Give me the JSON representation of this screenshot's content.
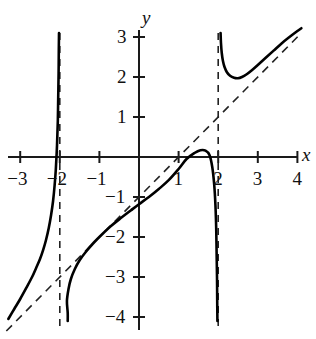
{
  "chart_data": {
    "type": "line",
    "title": "",
    "subtitle": "",
    "xlabel": "x",
    "ylabel": "y",
    "xlim": [
      -3.3,
      4.2
    ],
    "ylim": [
      -4.2,
      3.3
    ],
    "grid": false,
    "legend": null,
    "x_ticks": [
      {
        "value": -3,
        "label": "−3"
      },
      {
        "value": -2,
        "label": "−2"
      },
      {
        "value": -1,
        "label": "−1"
      },
      {
        "value": 1,
        "label": "1"
      },
      {
        "value": 2,
        "label": "2"
      },
      {
        "value": 3,
        "label": "3"
      },
      {
        "value": 4,
        "label": "4"
      }
    ],
    "y_ticks": [
      {
        "value": 3,
        "label": "3"
      },
      {
        "value": 2,
        "label": "2"
      },
      {
        "value": 1,
        "label": "1"
      },
      {
        "value": -1,
        "label": "−1"
      },
      {
        "value": -2,
        "label": "−2"
      },
      {
        "value": -3,
        "label": "−3"
      },
      {
        "value": -4,
        "label": "−4"
      }
    ],
    "asymptotes": [
      {
        "name": "vertical-asymptote-left",
        "kind": "vertical",
        "x": -2,
        "style": "dashed"
      },
      {
        "name": "vertical-asymptote-right",
        "kind": "vertical",
        "x": 2,
        "style": "dashed"
      },
      {
        "name": "slant-asymptote",
        "kind": "slant",
        "slope": 1,
        "intercept": -1,
        "equation": "y = x − 1",
        "style": "dashed"
      }
    ],
    "series": [
      {
        "name": "branch-left",
        "style": "solid",
        "color": "#000000",
        "points": [
          [
            -3.3,
            -4.05
          ],
          [
            -3.15,
            -3.8
          ],
          [
            -3.0,
            -3.55
          ],
          [
            -2.85,
            -3.28
          ],
          [
            -2.7,
            -3.0
          ],
          [
            -2.6,
            -2.78
          ],
          [
            -2.5,
            -2.55
          ],
          [
            -2.42,
            -2.32
          ],
          [
            -2.35,
            -2.08
          ],
          [
            -2.28,
            -1.78
          ],
          [
            -2.22,
            -1.45
          ],
          [
            -2.17,
            -1.1
          ],
          [
            -2.13,
            -0.7
          ],
          [
            -2.1,
            -0.3
          ],
          [
            -2.07,
            0.3
          ],
          [
            -2.05,
            0.9
          ],
          [
            -2.04,
            1.5
          ],
          [
            -2.03,
            2.1
          ],
          [
            -2.025,
            2.7
          ],
          [
            -2.02,
            3.1
          ]
        ]
      },
      {
        "name": "branch-middle",
        "style": "solid",
        "color": "#000000",
        "points": [
          [
            -1.8,
            -4.1
          ],
          [
            -1.8,
            -3.9
          ],
          [
            -1.82,
            -3.6
          ],
          [
            -1.78,
            -3.3
          ],
          [
            -1.72,
            -3.05
          ],
          [
            -1.62,
            -2.8
          ],
          [
            -1.5,
            -2.58
          ],
          [
            -1.35,
            -2.38
          ],
          [
            -1.15,
            -2.15
          ],
          [
            -0.95,
            -1.95
          ],
          [
            -0.7,
            -1.72
          ],
          [
            -0.45,
            -1.52
          ],
          [
            -0.2,
            -1.33
          ],
          [
            0.0,
            -1.18
          ],
          [
            0.25,
            -1.0
          ],
          [
            0.5,
            -0.8
          ],
          [
            0.75,
            -0.58
          ],
          [
            1.0,
            -0.3
          ],
          [
            1.2,
            -0.05
          ],
          [
            1.4,
            0.1
          ],
          [
            1.55,
            0.17
          ],
          [
            1.68,
            0.16
          ],
          [
            1.78,
            0.05
          ],
          [
            1.85,
            -0.25
          ],
          [
            1.9,
            -0.7
          ],
          [
            1.93,
            -1.2
          ],
          [
            1.95,
            -1.8
          ],
          [
            1.96,
            -2.4
          ],
          [
            1.97,
            -3.0
          ],
          [
            1.975,
            -3.6
          ],
          [
            1.98,
            -4.1
          ]
        ]
      },
      {
        "name": "branch-right",
        "style": "solid",
        "color": "#000000",
        "points": [
          [
            2.06,
            3.1
          ],
          [
            2.07,
            2.85
          ],
          [
            2.09,
            2.6
          ],
          [
            2.12,
            2.4
          ],
          [
            2.16,
            2.25
          ],
          [
            2.22,
            2.12
          ],
          [
            2.3,
            2.03
          ],
          [
            2.4,
            1.98
          ],
          [
            2.5,
            1.97
          ],
          [
            2.6,
            2.0
          ],
          [
            2.72,
            2.07
          ],
          [
            2.85,
            2.17
          ],
          [
            3.0,
            2.3
          ],
          [
            3.2,
            2.48
          ],
          [
            3.4,
            2.66
          ],
          [
            3.6,
            2.84
          ],
          [
            3.8,
            3.0
          ],
          [
            4.0,
            3.15
          ],
          [
            4.1,
            3.22
          ]
        ]
      }
    ]
  },
  "axes": {
    "x_axis_label": "x",
    "y_axis_label": "y"
  }
}
